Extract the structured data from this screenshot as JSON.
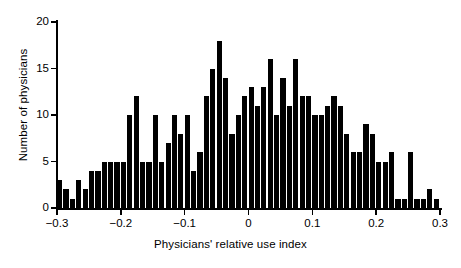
{
  "chart_data": {
    "type": "bar",
    "title": "",
    "subtitle": "",
    "xlabel": "Physicians' relative use index",
    "ylabel": "Number of physicians",
    "xlim": [
      -0.3,
      0.3
    ],
    "ylim": [
      0,
      20
    ],
    "grid": false,
    "legend": null,
    "bar_color": "#000000",
    "background_color": "#ffffff",
    "bin_width": 0.01,
    "x_ticks": [
      -0.3,
      -0.2,
      -0.1,
      0,
      0.1,
      0.2,
      0.3
    ],
    "x_tick_labels": [
      "−0.3",
      "−0.2",
      "−0.1",
      "0",
      "0.1",
      "0.2",
      "0.3"
    ],
    "y_ticks": [
      0,
      5,
      10,
      15,
      20
    ],
    "y_tick_labels": [
      "0",
      "5",
      "10",
      "15",
      "20"
    ],
    "bin_centers": [
      -0.295,
      -0.285,
      -0.275,
      -0.265,
      -0.255,
      -0.245,
      -0.235,
      -0.225,
      -0.215,
      -0.205,
      -0.195,
      -0.185,
      -0.175,
      -0.165,
      -0.155,
      -0.145,
      -0.135,
      -0.125,
      -0.115,
      -0.105,
      -0.095,
      -0.085,
      -0.075,
      -0.065,
      -0.055,
      -0.045,
      -0.035,
      -0.025,
      -0.015,
      -0.005,
      0.005,
      0.015,
      0.025,
      0.035,
      0.045,
      0.055,
      0.065,
      0.075,
      0.085,
      0.095,
      0.105,
      0.115,
      0.125,
      0.135,
      0.145,
      0.155,
      0.165,
      0.175,
      0.185,
      0.195,
      0.205,
      0.215,
      0.225,
      0.235,
      0.245,
      0.255,
      0.265,
      0.275,
      0.285,
      0.295
    ],
    "values": [
      3,
      2,
      1,
      3,
      2,
      4,
      4,
      5,
      5,
      5,
      5,
      10,
      12,
      5,
      5,
      10,
      5,
      7,
      10,
      8,
      10,
      4,
      6,
      12,
      15,
      18,
      14,
      8,
      10,
      12,
      13,
      11,
      13,
      16,
      10,
      14,
      11,
      16,
      12,
      12,
      10,
      10,
      11,
      12,
      11,
      8,
      6,
      6,
      9,
      8,
      5,
      5,
      6,
      1,
      1,
      6,
      1,
      1,
      2,
      1
    ],
    "categories": [
      "-0.295",
      "-0.285",
      "-0.275",
      "-0.265",
      "-0.255",
      "-0.245",
      "-0.235",
      "-0.225",
      "-0.215",
      "-0.205",
      "-0.195",
      "-0.185",
      "-0.175",
      "-0.165",
      "-0.155",
      "-0.145",
      "-0.135",
      "-0.125",
      "-0.115",
      "-0.105",
      "-0.095",
      "-0.085",
      "-0.075",
      "-0.065",
      "-0.055",
      "-0.045",
      "-0.035",
      "-0.025",
      "-0.015",
      "-0.005",
      "0.005",
      "0.015",
      "0.025",
      "0.035",
      "0.045",
      "0.055",
      "0.065",
      "0.075",
      "0.085",
      "0.095",
      "0.105",
      "0.115",
      "0.125",
      "0.135",
      "0.145",
      "0.155",
      "0.165",
      "0.175",
      "0.185",
      "0.195",
      "0.205",
      "0.215",
      "0.225",
      "0.235",
      "0.245",
      "0.255",
      "0.265",
      "0.275",
      "0.285",
      "0.295"
    ]
  }
}
